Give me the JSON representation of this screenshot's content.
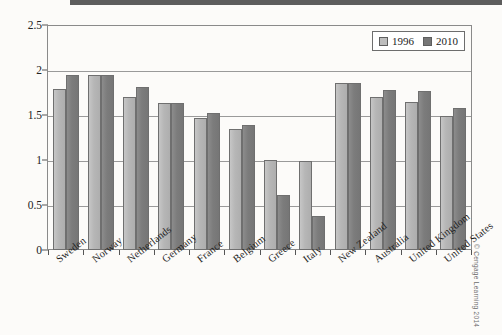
{
  "chart_data": {
    "type": "bar",
    "title": "",
    "xlabel": "",
    "ylabel": "",
    "ylim": [
      0,
      2.5
    ],
    "ytick_labels": [
      "0",
      "0.5",
      "1",
      "1.5",
      "2",
      "2.5"
    ],
    "ytick_values": [
      0,
      0.5,
      1,
      1.5,
      2,
      2.5
    ],
    "grid": true,
    "legend_position": "top-right",
    "categories": [
      "Sweden",
      "Norway",
      "Netherlands",
      "Germany",
      "France",
      "Belgium",
      "Greece",
      "Italy",
      "New Zealand",
      "Australia",
      "United Kingdom",
      "United States"
    ],
    "series": [
      {
        "name": "1996",
        "color": "#bdbdbd",
        "values": [
          1.79,
          1.94,
          1.7,
          1.63,
          1.47,
          1.34,
          1.0,
          0.99,
          1.86,
          1.7,
          1.64,
          1.49
        ]
      },
      {
        "name": "2010",
        "color": "#767676",
        "values": [
          1.95,
          1.94,
          1.81,
          1.63,
          1.52,
          1.39,
          0.61,
          0.38,
          1.86,
          1.78,
          1.77,
          1.58
        ]
      }
    ]
  },
  "legend": {
    "entries": [
      {
        "label": "1996",
        "swatch": "light-gray-swatch"
      },
      {
        "label": "2010",
        "swatch": "dark-gray-swatch"
      }
    ]
  },
  "credit": {
    "text": "© Cengage Learning 2014"
  }
}
